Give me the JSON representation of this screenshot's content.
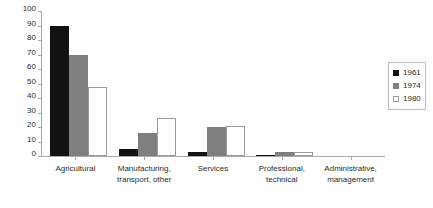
{
  "chart_data": {
    "type": "bar",
    "title": "",
    "xlabel": "",
    "ylabel": "",
    "ylim": [
      0,
      100
    ],
    "ytick_labels": [
      "100",
      "90",
      "80",
      "70",
      "60",
      "50",
      "40",
      "30",
      "20",
      "10",
      "0"
    ],
    "ytick_values": [
      100,
      90,
      80,
      70,
      60,
      50,
      40,
      30,
      20,
      10,
      0
    ],
    "grid": false,
    "legend_position": "right",
    "categories": [
      "Agricultural",
      "Manufacturing,\ntransport, other",
      "Services",
      "Professional,\ntechnical",
      "Administrative,\nmanagement"
    ],
    "series": [
      {
        "name": "1961",
        "color": "#111111",
        "values": [
          90,
          5,
          3,
          1,
          0
        ]
      },
      {
        "name": "1974",
        "color": "#7f7f7f",
        "values": [
          70,
          16,
          20,
          3,
          0
        ]
      },
      {
        "name": "1980",
        "color": "#ffffff",
        "values": [
          47.5,
          26,
          21,
          3,
          0
        ]
      }
    ]
  },
  "legend": {
    "entries": [
      {
        "label": "1961"
      },
      {
        "label": "1974"
      },
      {
        "label": "1980"
      }
    ]
  }
}
